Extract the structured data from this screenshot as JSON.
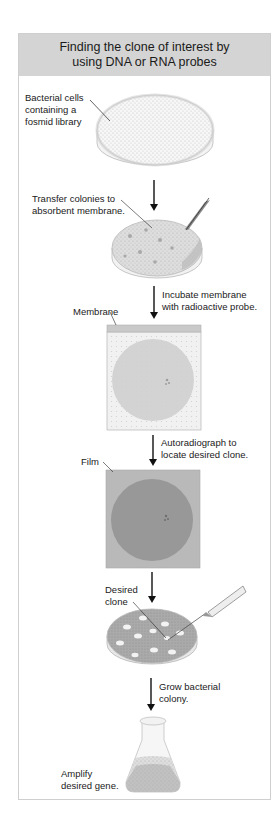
{
  "figure": {
    "title_line1": "Finding the clone of interest by",
    "title_line2": "using DNA or RNA probes",
    "colors": {
      "header_bg": "#d4d4d4",
      "frame_border": "#cfcfcf",
      "membrane_bg": "#efefef",
      "membrane_circle": "#cdcdcd",
      "film_bg": "#b8b8b8",
      "film_circle": "#989898",
      "arrow": "#111111"
    },
    "steps": [
      {
        "id": "plate",
        "label_lines": [
          "Bacterial cells",
          "containing a",
          "fosmid library"
        ]
      },
      {
        "id": "transfer",
        "label_lines": [
          "Transfer colonies to",
          "absorbent membrane."
        ]
      },
      {
        "id": "incubate",
        "label_lines": [
          "Incubate membrane",
          "with radioactive probe."
        ]
      },
      {
        "id": "membrane",
        "label_lines": [
          "Membrane"
        ]
      },
      {
        "id": "autoradiograph",
        "label_lines": [
          "Autoradiograph to",
          "locate desired clone."
        ]
      },
      {
        "id": "film",
        "label_lines": [
          "Film"
        ]
      },
      {
        "id": "desired-clone",
        "label_lines": [
          "Desired",
          "clone"
        ]
      },
      {
        "id": "grow",
        "label_lines": [
          "Grow bacterial",
          "colony."
        ]
      },
      {
        "id": "amplify",
        "label_lines": [
          "Amplify",
          "desired gene."
        ]
      }
    ]
  }
}
